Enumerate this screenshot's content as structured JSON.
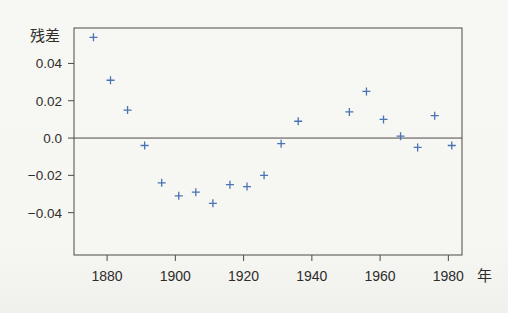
{
  "figure": {
    "background_color": "#f6f6f3",
    "axis_color": "#4c4a47",
    "text_color": "#2e2d2a",
    "marker_color": "#4a73b4"
  },
  "chart_data": {
    "type": "scatter",
    "marker": "plus",
    "title": "",
    "xlabel": "年",
    "ylabel": "残差",
    "x": [
      1876,
      1881,
      1886,
      1891,
      1896,
      1901,
      1906,
      1911,
      1916,
      1921,
      1926,
      1931,
      1936,
      1951,
      1956,
      1961,
      1966,
      1971,
      1976,
      1981
    ],
    "y": [
      0.054,
      0.031,
      0.015,
      -0.004,
      -0.024,
      -0.031,
      -0.029,
      -0.035,
      -0.025,
      -0.026,
      -0.02,
      -0.003,
      0.009,
      0.014,
      0.025,
      0.01,
      0.001,
      -0.005,
      0.012,
      -0.004
    ],
    "x_ticks": [
      1880,
      1900,
      1920,
      1940,
      1960,
      1980
    ],
    "x_tick_labels": [
      "1880",
      "1900",
      "1920",
      "1940",
      "1960",
      "1980"
    ],
    "y_ticks": [
      0.04,
      0.02,
      0.0,
      -0.02,
      -0.04
    ],
    "y_tick_labels": [
      "0.04",
      "0.02",
      "0.0",
      "−0.02",
      "−0.04"
    ],
    "xlim": [
      1870.3,
      1984.0
    ],
    "ylim": [
      -0.0627,
      0.059
    ],
    "zero_line": true,
    "grid": false,
    "legend": false
  }
}
